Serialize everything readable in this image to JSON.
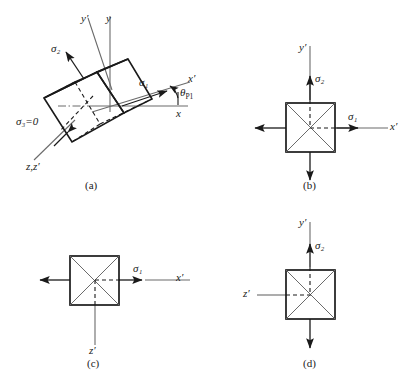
{
  "figure": {
    "background_color": "#ffffff",
    "line_color": "#1a1a1a",
    "axis_color": "#6b6b6b",
    "panels": [
      {
        "id": "a",
        "caption": "(a)",
        "description": "rotated 3D cube element showing principal stresses",
        "axes": [
          {
            "name": "y-prime-axis",
            "label": "y′"
          },
          {
            "name": "y-axis",
            "label": "y"
          },
          {
            "name": "x-prime-axis",
            "label": "x′"
          },
          {
            "name": "x-axis",
            "label": "x"
          },
          {
            "name": "z-zprime-axis",
            "label": "z,z′"
          }
        ],
        "stresses": [
          {
            "name": "sigma-2",
            "symbol": "σ",
            "subscript": "2",
            "text": "σ₂"
          },
          {
            "name": "sigma-1",
            "symbol": "σ",
            "subscript": "1",
            "text": "σ₁"
          },
          {
            "name": "sigma-3-zero",
            "symbol": "σ",
            "subscript": "3",
            "text": "σ₃=0"
          }
        ],
        "angle": {
          "name": "theta-p1",
          "text": "θ",
          "subscript": "P1"
        }
      },
      {
        "id": "b",
        "caption": "(b)",
        "description": "front view square element with sigma1 and sigma2",
        "axes": [
          {
            "name": "y-prime-axis",
            "label": "y′"
          },
          {
            "name": "x-prime-axis",
            "label": "x′"
          }
        ],
        "stresses": [
          {
            "name": "sigma-2",
            "text": "σ₂"
          },
          {
            "name": "sigma-1",
            "text": "σ₁"
          }
        ]
      },
      {
        "id": "c",
        "caption": "(c)",
        "description": "top view square element with sigma1 only",
        "axes": [
          {
            "name": "x-prime-axis",
            "label": "x′"
          },
          {
            "name": "z-prime-axis",
            "label": "z′"
          }
        ],
        "stresses": [
          {
            "name": "sigma-1",
            "text": "σ₁"
          }
        ]
      },
      {
        "id": "d",
        "caption": "(d)",
        "description": "side view square element with sigma2 only",
        "axes": [
          {
            "name": "y-prime-axis",
            "label": "y′"
          },
          {
            "name": "z-prime-axis",
            "label": "z′"
          }
        ],
        "stresses": [
          {
            "name": "sigma-2",
            "text": "σ₂"
          }
        ]
      }
    ]
  },
  "labels": {
    "panel_a_caption": "(a)",
    "panel_b_caption": "(b)",
    "panel_c_caption": "(c)",
    "panel_d_caption": "(d)",
    "a_y_prime": "y′",
    "a_y": "y",
    "a_x_prime": "x′",
    "a_x": "x",
    "a_z_zprime": "z,z′",
    "a_sigma2": "σ₂",
    "a_sigma1": "σ₁",
    "a_sigma3": "σ₃=0",
    "a_theta": "θ",
    "a_theta_sub": "P1",
    "b_y_prime": "y′",
    "b_x_prime": "x′",
    "b_sigma2": "σ₂",
    "b_sigma1": "σ₁",
    "c_x_prime": "x′",
    "c_z_prime": "z′",
    "c_sigma1": "σ₁",
    "d_y_prime": "y′",
    "d_z_prime": "z′",
    "d_sigma2": "σ₂"
  }
}
